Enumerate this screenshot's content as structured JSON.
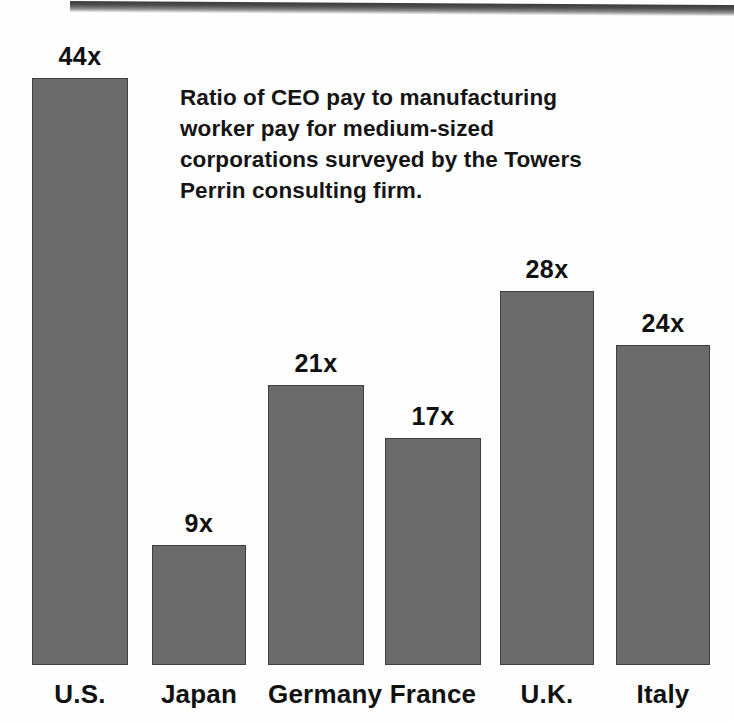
{
  "caption": "Ratio of CEO pay to manufacturing worker pay for medium-sized corporations surveyed by the Towers Perrin consulting firm.",
  "colors": {
    "bar_fill": "#6b6b6b",
    "bar_outline": "#3f3f3f",
    "text": "#111111",
    "background": "#fefefe"
  },
  "chart_data": {
    "type": "bar",
    "title": "Ratio of CEO pay to manufacturing worker pay for medium-sized corporations surveyed by the Towers Perrin consulting firm.",
    "xlabel": "",
    "ylabel": "",
    "ylim": [
      0,
      44
    ],
    "grid": false,
    "legend": "none",
    "orientation": "vertical",
    "categories": [
      "U.S.",
      "Japan",
      "Germany",
      "France",
      "U.K.",
      "Italy"
    ],
    "values": [
      44,
      9,
      21,
      17,
      28,
      24
    ],
    "value_labels": [
      "44x",
      "9x",
      "21x",
      "17x",
      "28x",
      "24x"
    ],
    "unit_suffix": "x",
    "bars": [
      {
        "category": "U.S.",
        "value": 44,
        "label": "44x",
        "left": 32,
        "width": 96
      },
      {
        "category": "Japan",
        "value": 9,
        "label": "9x",
        "left": 152,
        "width": 94
      },
      {
        "category": "Germany",
        "value": 21,
        "label": "21x",
        "left": 268,
        "width": 96
      },
      {
        "category": "France",
        "value": 17,
        "label": "17x",
        "left": 385,
        "width": 96
      },
      {
        "category": "U.K.",
        "value": 28,
        "label": "28x",
        "left": 500,
        "width": 94
      },
      {
        "category": "Italy",
        "value": 24,
        "label": "24x",
        "left": 616,
        "width": 94
      }
    ]
  }
}
